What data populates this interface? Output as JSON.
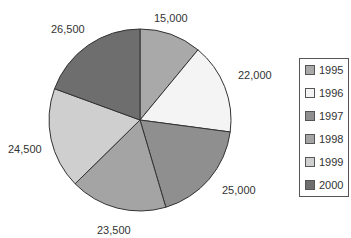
{
  "chart_data": {
    "type": "pie",
    "title": "",
    "categories": [
      "1995",
      "1996",
      "1997",
      "1998",
      "1999",
      "2000"
    ],
    "values": [
      15000,
      22000,
      25000,
      23500,
      24500,
      26500
    ],
    "value_labels": [
      "15,000",
      "22,000",
      "25,000",
      "23,500",
      "24,500",
      "26,500"
    ],
    "colors": [
      "#a9a9a9",
      "#f4f4f4",
      "#8f8f8f",
      "#a4a4a4",
      "#cfcfcf",
      "#6e6e6e"
    ],
    "start_angle": "top (12 o'clock)",
    "direction": "clockwise",
    "legend": {
      "position": "right",
      "entries": [
        "1995",
        "1996",
        "1997",
        "1998",
        "1999",
        "2000"
      ]
    }
  },
  "labels": {
    "l1995": "15,000",
    "l1996": "22,000",
    "l1997": "25,000",
    "l1998": "23,500",
    "l1999": "24,500",
    "l2000": "26,500"
  }
}
